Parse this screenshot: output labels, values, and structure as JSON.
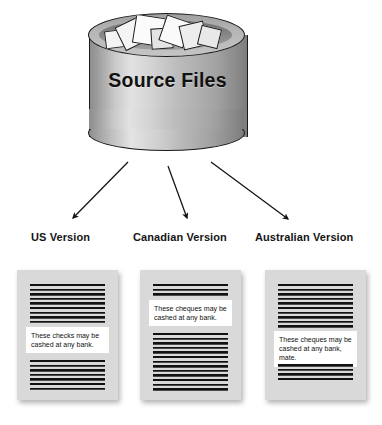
{
  "diagram": {
    "source": {
      "label": "Source Files",
      "shape": "cylinder-database",
      "contents_icon": "paper-sheets-icon"
    },
    "arrows": [
      {
        "name": "arrow-to-us",
        "from": "source-files",
        "to": "us-version"
      },
      {
        "name": "arrow-to-canadian",
        "from": "source-files",
        "to": "canadian-version"
      },
      {
        "name": "arrow-to-australian",
        "from": "source-files",
        "to": "australian-version"
      }
    ],
    "versions": [
      {
        "id": "us",
        "label": "US Version",
        "callout_text": "These checks may be cashed at any bank.",
        "callout_position": "middle"
      },
      {
        "id": "canadian",
        "label": "Canadian Version",
        "callout_text": "These cheques may be cashed at any bank.",
        "callout_position": "upper"
      },
      {
        "id": "australian",
        "label": "Australian Version",
        "callout_text": "These cheques may be cashed at any bank, mate.",
        "callout_position": "lower"
      }
    ]
  },
  "colors": {
    "page_background": "#ffffff",
    "panel_background": "#d9d9d9",
    "callout_background": "#ffffff",
    "text": "#111111",
    "stroke": "#1a1a1a"
  }
}
